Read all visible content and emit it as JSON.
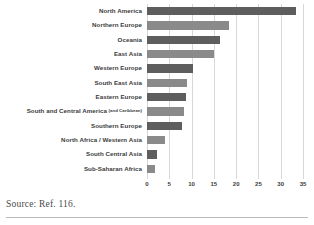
{
  "source_note": "Source: Ref. 116.",
  "chart_data": {
    "type": "bar",
    "orientation": "horizontal",
    "title": "",
    "subtitle": "",
    "xlabel": "",
    "ylabel": "",
    "xlim": [
      0,
      35
    ],
    "ylim": null,
    "grid": true,
    "legend": false,
    "legend_position": "none",
    "xticks": [
      "0",
      "5",
      "10",
      "15",
      "20",
      "25",
      "30",
      "35"
    ],
    "xtick_values": [
      0,
      5,
      10,
      15,
      20,
      25,
      30,
      35
    ],
    "categories": [
      "North America",
      "Northern Europe",
      "Oceania",
      "East Asia",
      "Western Europe",
      "South East Asia",
      "Eastern Europe",
      "South and Central America",
      "Southern Europe",
      "North Africa / Western Asia",
      "South Central Asia",
      "Sub-Saharan Africa"
    ],
    "category_annotations": [
      "",
      "",
      "",
      "",
      "",
      "",
      "",
      "(and Caribbean)",
      "",
      "",
      "",
      ""
    ],
    "values": [
      33.5,
      18.5,
      16.3,
      15.0,
      10.3,
      9.0,
      8.8,
      8.4,
      7.8,
      4.0,
      2.2,
      1.8
    ],
    "bar_colors": [
      "#5e5e5e",
      "#8a8a8a",
      "#5e5e5e",
      "#8a8a8a",
      "#5e5e5e",
      "#8a8a8a",
      "#5e5e5e",
      "#8a8a8a",
      "#5e5e5e",
      "#8a8a8a",
      "#5e5e5e",
      "#8a8a8a"
    ],
    "grid_color": "#d8d8d8",
    "text_color": "#3b3b3b"
  }
}
